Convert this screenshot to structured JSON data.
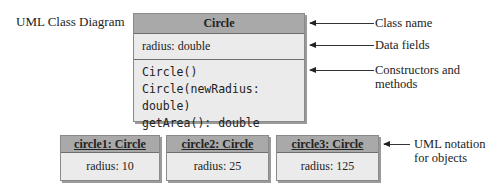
{
  "diagram": {
    "title": "UML Class Diagram",
    "class_box": {
      "name": "Circle",
      "fields": [
        "radius: double"
      ],
      "methods": [
        "Circle()",
        "Circle(newRadius: double)",
        "getArea(): double"
      ]
    },
    "annotations": {
      "class_name": "Class name",
      "data_fields": "Data fields",
      "constructors_line1": "Constructors and",
      "constructors_line2": "methods",
      "objects_line1": "UML notation",
      "objects_line2": "for objects"
    },
    "objects": [
      {
        "name": "circle1: Circle",
        "value": "radius: 10"
      },
      {
        "name": "circle2: Circle",
        "value": "radius: 25"
      },
      {
        "name": "circle3: Circle",
        "value": "radius: 125"
      }
    ],
    "colors": {
      "header_fill": "#a9a9a9",
      "body_fill": "#ebebeb",
      "border": "#6e6e6e"
    }
  }
}
